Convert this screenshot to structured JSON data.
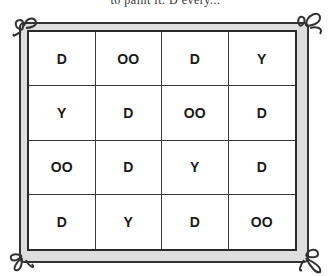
{
  "caption": "to paint it. D every...",
  "grid": {
    "rows": [
      [
        "D",
        "OO",
        "D",
        "Y"
      ],
      [
        "Y",
        "D",
        "OO",
        "D"
      ],
      [
        "OO",
        "D",
        "Y",
        "D"
      ],
      [
        "D",
        "Y",
        "D",
        "OO"
      ]
    ]
  },
  "colors": {
    "frame_fill": "#dedede",
    "frame_line": "#333333",
    "text": "#1a1a1a"
  }
}
